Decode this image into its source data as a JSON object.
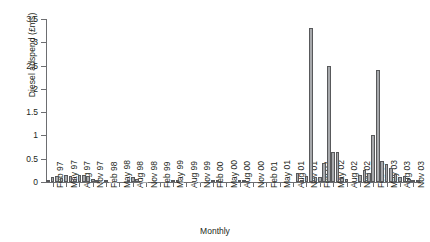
{
  "chart_data": {
    "type": "bar",
    "title": "",
    "xlabel": "Monthly",
    "ylabel": "Diesel adspend (£ms)",
    "ylim": [
      0,
      3.5
    ],
    "yticks": [
      0,
      0.5,
      1,
      1.5,
      2,
      2.5,
      3,
      3.5
    ],
    "ytick_labels": [
      "0",
      "0.5",
      "1",
      "1.5",
      "2",
      "2.5",
      "3",
      "3.5"
    ],
    "grid": false,
    "legend": false,
    "bar_color": "#a7a9ac",
    "bar_edge_color": "#58595b",
    "axis_color": "#6d6e71",
    "xtick_labels": [
      "Feb 97",
      "May 97",
      "Aug 97",
      "Nov 97",
      "Feb 98",
      "May 98",
      "Aug 98",
      "Nov 98",
      "Feb 99",
      "May 99",
      "Aug 99",
      "Nov 99",
      "Feb 00",
      "May 00",
      "Aug 00",
      "Nov 00",
      "Feb 01",
      "May 01",
      "Aug 01",
      "Nov 01",
      "Feb 02",
      "May 02",
      "Aug 02",
      "Nov 02",
      "Feb 03",
      "May 03",
      "Aug 03",
      "Nov 03"
    ],
    "x": [
      "Jan 97",
      "Feb 97",
      "Mar 97",
      "Apr 97",
      "May 97",
      "Jun 97",
      "Jul 97",
      "Aug 97",
      "Sep 97",
      "Oct 97",
      "Nov 97",
      "Dec 97",
      "Jan 98",
      "Feb 98",
      "Mar 98",
      "Apr 98",
      "May 98",
      "Jun 98",
      "Jul 98",
      "Aug 98",
      "Sep 98",
      "Oct 98",
      "Nov 98",
      "Dec 98",
      "Jan 99",
      "Feb 99",
      "Mar 99",
      "Apr 99",
      "May 99",
      "Jun 99",
      "Jul 99",
      "Aug 99",
      "Sep 99",
      "Oct 99",
      "Nov 99",
      "Dec 99",
      "Jan 00",
      "Feb 00",
      "Mar 00",
      "Apr 00",
      "May 00",
      "Jun 00",
      "Jul 00",
      "Aug 00",
      "Sep 00",
      "Oct 00",
      "Nov 00",
      "Dec 00",
      "Jan 01",
      "Feb 01",
      "Mar 01",
      "Apr 01",
      "May 01",
      "Jun 01",
      "Jul 01",
      "Aug 01",
      "Sep 01",
      "Oct 01",
      "Nov 01",
      "Dec 01",
      "Jan 02",
      "Feb 02",
      "Mar 02",
      "Apr 02",
      "May 02",
      "Jun 02",
      "Jul 02",
      "Aug 02",
      "Sep 02",
      "Oct 02",
      "Nov 02",
      "Dec 02",
      "Jan 03",
      "Feb 03",
      "Mar 03",
      "Apr 03",
      "May 03",
      "Jun 03",
      "Jul 03",
      "Aug 03",
      "Sep 03",
      "Oct 03",
      "Nov 03",
      "Dec 03"
    ],
    "values": [
      0.04,
      0.1,
      0.12,
      0.09,
      0.15,
      0.13,
      0.07,
      0.15,
      0.14,
      0.13,
      0.06,
      0.02,
      0.01,
      0.03,
      0.01,
      0.01,
      0.0,
      0.0,
      0.02,
      0.11,
      0.06,
      0.01,
      0.01,
      0.0,
      0.0,
      0.0,
      0.0,
      0.0,
      0.02,
      0.04,
      0.01,
      0.0,
      0.0,
      0.01,
      0.01,
      0.0,
      0.0,
      0.02,
      0.05,
      0.0,
      0.0,
      0.0,
      0.0,
      0.02,
      0.02,
      0.0,
      0.0,
      0.0,
      0.0,
      0.0,
      0.0,
      0.0,
      0.0,
      0.0,
      0.0,
      0.0,
      0.2,
      0.05,
      0.12,
      3.3,
      0.1,
      0.1,
      0.4,
      2.5,
      0.65,
      0.65,
      0.09,
      0.07,
      0.0,
      0.0,
      0.15,
      0.25,
      0.2,
      1.0,
      2.4,
      0.45,
      0.38,
      0.3,
      0.18,
      0.1,
      0.12,
      0.07,
      0.05,
      0.03
    ]
  }
}
